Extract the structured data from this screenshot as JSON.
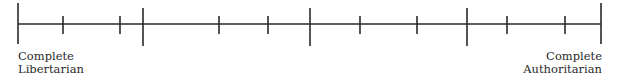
{
  "diagram": {
    "type": "spectrum-scale",
    "line_color": "#2a2a2a",
    "axis": {
      "x_start": 18,
      "x_end": 601,
      "y": 24
    },
    "ticks": [
      {
        "x": 18,
        "kind": "end"
      },
      {
        "x": 63,
        "kind": "minor"
      },
      {
        "x": 120,
        "kind": "minor"
      },
      {
        "x": 143,
        "kind": "major"
      },
      {
        "x": 219,
        "kind": "minor"
      },
      {
        "x": 268,
        "kind": "minor"
      },
      {
        "x": 310,
        "kind": "major"
      },
      {
        "x": 360,
        "kind": "minor"
      },
      {
        "x": 417,
        "kind": "minor"
      },
      {
        "x": 467,
        "kind": "major"
      },
      {
        "x": 507,
        "kind": "minor"
      },
      {
        "x": 565,
        "kind": "minor"
      },
      {
        "x": 601,
        "kind": "end"
      }
    ],
    "left_label": {
      "line1": "Complete",
      "line2": "Libertarian"
    },
    "right_label": {
      "line1": "Complete",
      "line2": "Authoritarian"
    }
  }
}
